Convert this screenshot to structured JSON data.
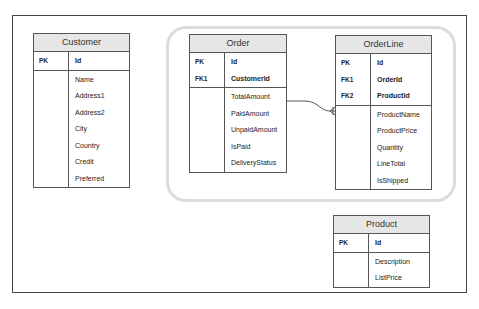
{
  "tables": {
    "customer": {
      "title": "Customer",
      "keys": [
        {
          "key": "PK",
          "field": "Id"
        }
      ],
      "attributes": [
        "Name",
        "Address1",
        "Address2",
        "City",
        "Country",
        "Credit",
        "Preferred"
      ]
    },
    "order": {
      "title": "Order",
      "keys": [
        {
          "key": "PK",
          "field": "Id"
        },
        {
          "key": "FK1",
          "field": "CustomerId"
        }
      ],
      "attributes": [
        "TotalAmount",
        "PaidAmount",
        "UnpaidAmount",
        "IsPaid",
        "DeliveryStatus"
      ]
    },
    "orderline": {
      "title": "OrderLine",
      "keys": [
        {
          "key": "PK",
          "field": "Id"
        },
        {
          "key": "FK1",
          "field": "OrderId"
        },
        {
          "key": "FK2",
          "field": "ProductId"
        }
      ],
      "attributes": [
        "ProductName",
        "ProductPrice",
        "Quantity",
        "LineTotal",
        "IsShipped"
      ]
    },
    "product": {
      "title": "Product",
      "keys": [
        {
          "key": "PK",
          "field": "Id"
        }
      ],
      "attributes": [
        "Description",
        "ListPrice"
      ]
    }
  },
  "relationships": [
    {
      "from": "order",
      "to": "orderline",
      "type": "one-to-many"
    }
  ],
  "colors": {
    "header_bg": "#e6e6e6",
    "border": "#555555",
    "group_border": "#dcdcdc"
  }
}
